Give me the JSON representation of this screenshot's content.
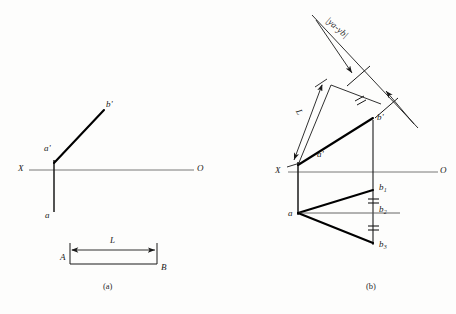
{
  "figure": {
    "background_color": "#fdfdfc",
    "ink_color": "#1a1a1a",
    "thick_color": "#000000",
    "panels": [
      {
        "caption": "(a)",
        "axis_left_label": "X",
        "axis_right_label": "O",
        "point_labels": [
          "b'",
          "a'",
          "a"
        ],
        "dimension": {
          "length_label": "L",
          "left_label": "A",
          "right_label": "B"
        }
      },
      {
        "caption": "(b)",
        "axis_left_label": "X",
        "axis_right_label": "O",
        "point_labels": [
          "b'",
          "a'",
          "a"
        ],
        "rotated_dimension_label": "L",
        "delta_y_label": "|ya-yb|",
        "horizontal_points": [
          {
            "base": "b",
            "subscript": "1"
          },
          {
            "base": "b",
            "subscript": "2"
          },
          {
            "base": "b",
            "subscript": "3"
          }
        ]
      }
    ]
  },
  "labels": {
    "panel_a": {
      "caption": "(a)",
      "x_axis": "X",
      "o_axis": "O",
      "b_prime": "b'",
      "a_prime": "a'",
      "a": "a",
      "dim_L": "L",
      "dim_A": "A",
      "dim_B": "B"
    },
    "panel_b": {
      "caption": "(b)",
      "x_axis": "X",
      "o_axis": "O",
      "b_prime": "b'",
      "a_prime": "a'",
      "a": "a",
      "dim_L": "L",
      "delta_y": "|ya-yb|",
      "b1_base": "b",
      "b1_sub": "1",
      "b2_base": "b",
      "b2_sub": "2",
      "b3_base": "b",
      "b3_sub": "3"
    }
  }
}
